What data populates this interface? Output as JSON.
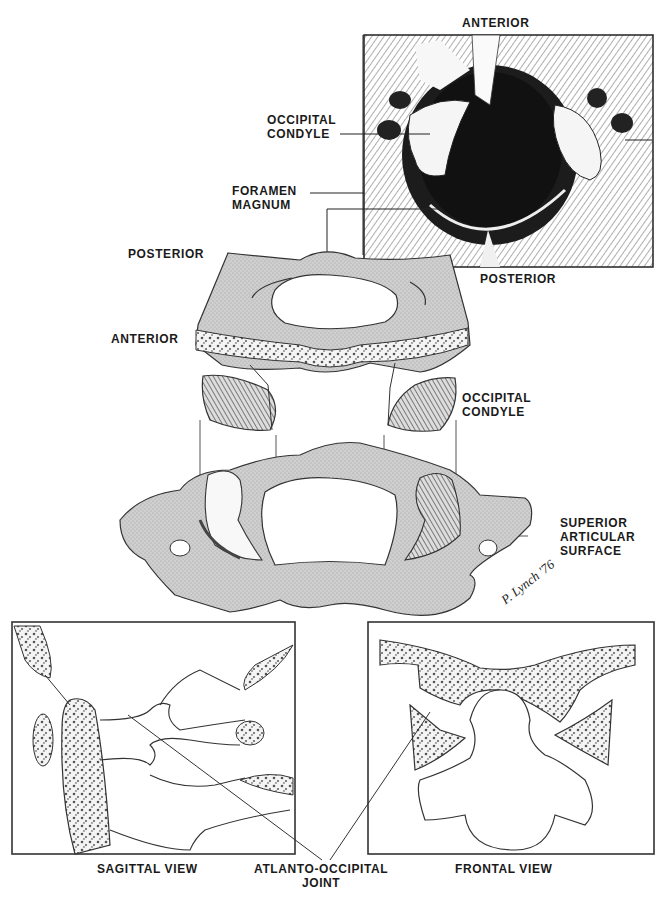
{
  "figure": {
    "inset_top": {
      "label_top": "ANTERIOR",
      "label_bottom": "POSTERIOR"
    },
    "labels": {
      "occipital_condyle_top": [
        "OCCIPITAL",
        "CONDYLE"
      ],
      "foramen_magnum": [
        "FORAMEN",
        "MAGNUM"
      ],
      "posterior": "POSTERIOR",
      "anterior": "ANTERIOR",
      "occipital_condyle_mid": [
        "OCCIPITAL",
        "CONDYLE"
      ],
      "superior_articular_surface": [
        "SUPERIOR",
        "ARTICULAR",
        "SURFACE"
      ],
      "atlanto_occipital_joint": [
        "ATLANTO-OCCIPITAL",
        "JOINT"
      ]
    },
    "panels": {
      "sagittal": "SAGITTAL VIEW",
      "frontal": "FRONTAL VIEW"
    },
    "signature": "P. Lynch '76",
    "colors": {
      "ink": "#222222",
      "bone_fill": "#c9c9c9",
      "cancellous": "#555555",
      "foramen_dark": "#1c1c1c",
      "paper": "#ffffff"
    }
  }
}
